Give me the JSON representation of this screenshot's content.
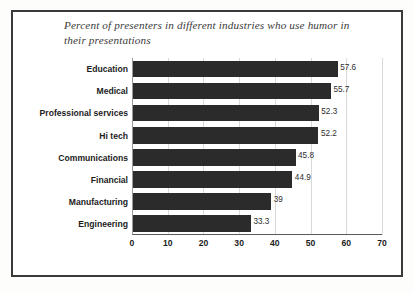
{
  "chart_data": {
    "type": "bar",
    "orientation": "horizontal",
    "title": "Percent of presenters in different industries who use humor in their presentations",
    "xlabel": "",
    "ylabel": "",
    "xlim": [
      0,
      70
    ],
    "xticks": [
      "0",
      "10",
      "20",
      "30",
      "40",
      "50",
      "60",
      "70"
    ],
    "grid": true,
    "legend": false,
    "bar_color": "#2b2b2b",
    "categories": [
      "Education",
      "Medical",
      "Professional services",
      "Hi tech",
      "Communications",
      "Financial",
      "Manufacturing",
      "Engineering"
    ],
    "values": [
      57.6,
      55.7,
      52.3,
      52.2,
      45.8,
      44.9,
      39,
      33.3
    ],
    "value_labels": [
      "57.6",
      "55.7",
      "52.3",
      "52.2",
      "45.8",
      "44.9",
      "39",
      "33.3"
    ]
  }
}
